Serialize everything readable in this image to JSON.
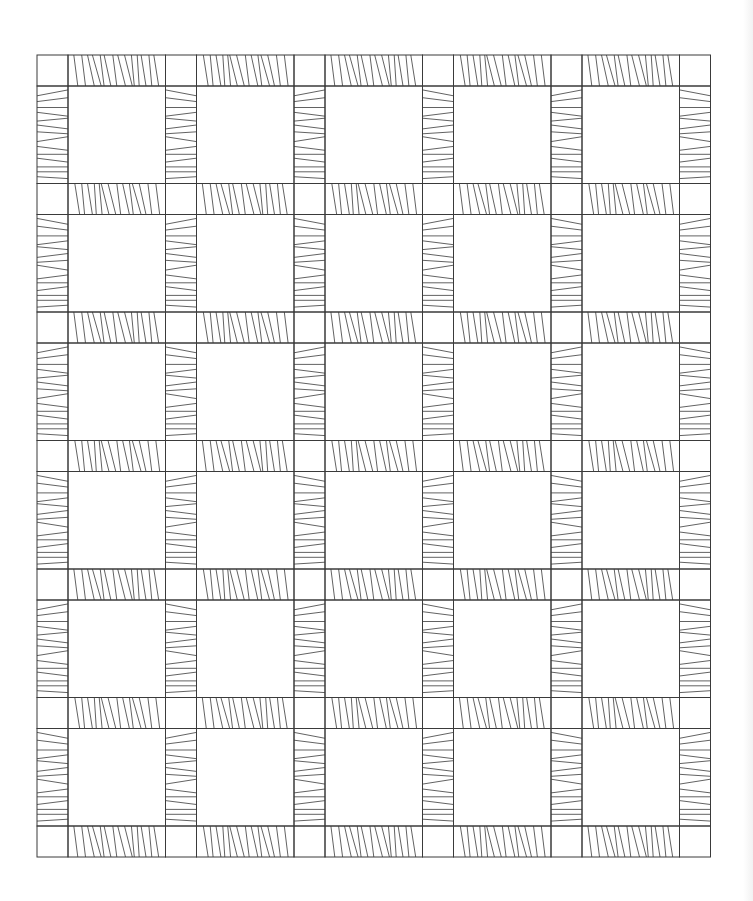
{
  "quilt": {
    "type": "sashed block quilt line drawing",
    "block_columns": 5,
    "block_rows": 6,
    "origin": {
      "x": 37,
      "y": 55
    },
    "cornerstone_size": 31,
    "block_size": 97.5,
    "period": 128.5,
    "line_color": "#3a3a3a",
    "background": "#ffffff",
    "strip_line_patterns": {
      "horizontal": [
        [
          6,
          10
        ],
        [
          14,
          18
        ],
        [
          20,
          27
        ],
        [
          25,
          34
        ],
        [
          33,
          37
        ],
        [
          37,
          44
        ],
        [
          46,
          50
        ],
        [
          51,
          59
        ],
        [
          58,
          66
        ],
        [
          65,
          68
        ],
        [
          71,
          73
        ],
        [
          75,
          80
        ],
        [
          83,
          86
        ],
        [
          88,
          93
        ]
      ],
      "vertical": [
        [
          10,
          4
        ],
        [
          16,
          12
        ],
        [
          22,
          22
        ],
        [
          27,
          31
        ],
        [
          36,
          33
        ],
        [
          40,
          44
        ],
        [
          47,
          49
        ],
        [
          57,
          52
        ],
        [
          62,
          66
        ],
        [
          70,
          70
        ],
        [
          74,
          78
        ],
        [
          83,
          83
        ],
        [
          88,
          88
        ],
        [
          93,
          95
        ]
      ]
    }
  }
}
